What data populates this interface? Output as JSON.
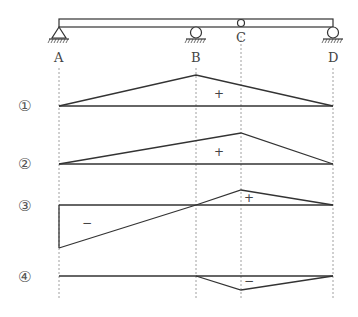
{
  "beam": {
    "supports": [
      {
        "label": "A",
        "type": "pin",
        "x": 59
      },
      {
        "label": "B",
        "type": "roller",
        "x": 196
      },
      {
        "label": "C",
        "type": "hinge",
        "x": 241
      },
      {
        "label": "D",
        "type": "roller",
        "x": 333
      }
    ]
  },
  "diagrams": [
    {
      "number": "①",
      "sign": "+",
      "shape": "triangle peak at B"
    },
    {
      "number": "②",
      "sign": "+",
      "shape": "triangle peak at C"
    },
    {
      "number": "③",
      "sign_left": "−",
      "sign_right": "+",
      "shape": "negative at A, zero at B, positive peak at C, zero at D"
    },
    {
      "number": "④",
      "sign": "−",
      "shape": "zero A–B, negative peak at C, zero at D"
    }
  ],
  "labels": {
    "A": "A",
    "B": "B",
    "C": "C",
    "D": "D",
    "d1": "①",
    "d2": "②",
    "d3": "③",
    "d4": "④",
    "plus": "+",
    "minus": "−"
  }
}
